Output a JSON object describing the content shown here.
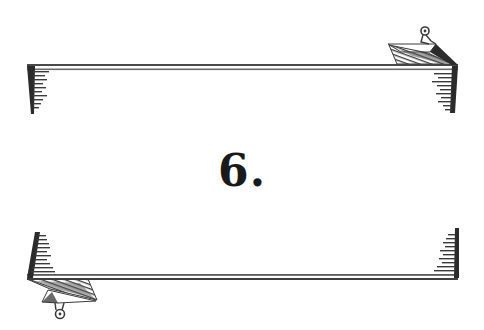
{
  "title": {
    "chapter_number": "6."
  },
  "decoration": {
    "top_banner": "ribbon-banner-top",
    "bottom_banner": "ribbon-banner-bottom",
    "ink_color": "#2b2b2b",
    "hatch_color": "#555555",
    "background": "#ffffff"
  }
}
